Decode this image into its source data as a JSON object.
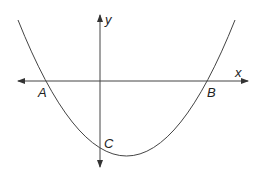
{
  "diagram": {
    "type": "parabola-on-axes",
    "axes": {
      "x_label": "x",
      "y_label": "y"
    },
    "points": [
      {
        "label": "A",
        "description": "left x-intercept"
      },
      {
        "label": "B",
        "description": "right x-intercept"
      },
      {
        "label": "C",
        "description": "y-intercept"
      }
    ],
    "colors": {
      "stroke": "#333333",
      "background": "#ffffff"
    }
  }
}
